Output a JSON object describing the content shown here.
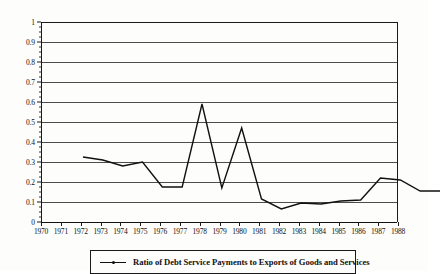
{
  "chart_data": {
    "type": "line",
    "title": "",
    "xlabel": "",
    "ylabel": "",
    "categories": [
      "1970",
      "1971",
      "1972",
      "1973",
      "1974",
      "1975",
      "1976",
      "1977",
      "1978",
      "1979",
      "1980",
      "1981",
      "1982",
      "1983",
      "1984",
      "1985",
      "1986",
      "1987",
      "1988"
    ],
    "values": [
      0.435,
      0.42,
      0.39,
      0.41,
      0.285,
      0.285,
      0.7,
      0.28,
      0.58,
      0.225,
      0.175,
      0.205,
      0.2,
      0.215,
      0.22,
      0.33,
      0.32,
      0.265,
      0.265
    ],
    "series": [
      {
        "name": "Ratio of Debt Service Payments to Exports of Goods and Services",
        "values": [
          0.435,
          0.42,
          0.39,
          0.41,
          0.285,
          0.285,
          0.7,
          0.28,
          0.58,
          0.225,
          0.175,
          0.205,
          0.2,
          0.215,
          0.22,
          0.33,
          0.32,
          0.265,
          0.265
        ],
        "color": "#111111"
      }
    ],
    "ylim": [
      0,
      1
    ],
    "ytick_labels": [
      "0",
      "0.1",
      "0.2",
      "0.3",
      "0.4",
      "0.5",
      "0.6",
      "0.7",
      "0.8",
      "0.9",
      "1"
    ],
    "ytick_values": [
      0,
      0.1,
      0.2,
      0.3,
      0.4,
      0.5,
      0.6,
      0.7,
      0.8,
      0.9,
      1
    ],
    "xlim": [
      "1970",
      "1988"
    ],
    "grid": true,
    "legend_position": "bottom-center"
  },
  "legend": {
    "entries": [
      {
        "label": "Ratio of Debt Service Payments to Exports of Goods and Services"
      }
    ]
  },
  "colors": {
    "line": "#111111",
    "grid": "#4d4d4d",
    "axis": "#1a1a1a",
    "background": "#fdfdfb",
    "text": "#111111"
  }
}
